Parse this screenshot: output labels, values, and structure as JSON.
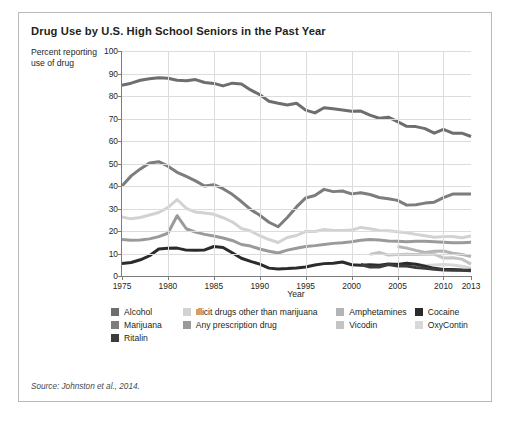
{
  "figure": {
    "title": "Drug Use by U.S. High School Seniors in the Past Year",
    "y_caption": "Percent reporting use of drug",
    "source": "Source: Johnston et al., 2014."
  },
  "legend": {
    "rows": [
      [
        {
          "label": "Alcohol",
          "color": "#6e6e6e",
          "col": "col-a"
        },
        {
          "label": "Illicit drugs other than marijuana",
          "color": "#d2d2d2",
          "col": "col-b"
        },
        {
          "label": "Amphetamines",
          "color": "#b4b4b4",
          "col": "col-c"
        },
        {
          "label": "Cocaine",
          "color": "#2b2b2b",
          "col": "col-d"
        }
      ],
      [
        {
          "label": "Marijuana",
          "color": "#7d7d7d",
          "col": "col-a"
        },
        {
          "label": "Any prescription drug",
          "color": "#9a9a9a",
          "col": "col-b"
        },
        {
          "label": "Vicodin",
          "color": "#c4c4c4",
          "col": "col-c"
        },
        {
          "label": "OxyContin",
          "color": "#d8d8d8",
          "col": "col-d"
        }
      ],
      [
        {
          "label": "Ritalin",
          "color": "#3c3c3c",
          "col": "col-a"
        }
      ]
    ]
  },
  "chart_data": {
    "type": "line",
    "title": "Drug Use by U.S. High School Seniors in the Past Year",
    "xlabel": "Year",
    "ylabel": "Percent reporting use of drug",
    "xlim": [
      1975,
      2013
    ],
    "ylim": [
      0,
      100
    ],
    "ytick_step": 10,
    "yticks": [
      0,
      10,
      20,
      30,
      40,
      50,
      60,
      70,
      80,
      90,
      100
    ],
    "xticks": [
      1975,
      1980,
      1985,
      1990,
      1995,
      2000,
      2005,
      2010,
      2013
    ],
    "xtick_labels": [
      "1975",
      "1980",
      "1985",
      "1990",
      "1995",
      "2000",
      "2005",
      "2010",
      "2013"
    ],
    "xtick_labels_shown": [
      "1975",
      "1980",
      "1985",
      "1990",
      "1995",
      "2000",
      "2005",
      "2010",
      "2013"
    ],
    "grid": true,
    "legend_position": "below",
    "series": [
      {
        "name": "Alcohol",
        "color": "#6e6e6e",
        "x": [
          1975,
          1976,
          1977,
          1978,
          1979,
          1980,
          1981,
          1982,
          1983,
          1984,
          1985,
          1986,
          1987,
          1988,
          1989,
          1990,
          1991,
          1992,
          1993,
          1994,
          1995,
          1996,
          1997,
          1998,
          1999,
          2000,
          2001,
          2002,
          2003,
          2004,
          2005,
          2006,
          2007,
          2008,
          2009,
          2010,
          2011,
          2012,
          2013
        ],
        "values": [
          84.8,
          85.7,
          87.0,
          87.7,
          88.1,
          87.9,
          87.0,
          86.8,
          87.3,
          86.0,
          85.6,
          84.5,
          85.7,
          85.3,
          82.7,
          80.6,
          77.7,
          76.8,
          76.0,
          76.8,
          73.7,
          72.5,
          74.8,
          74.3,
          73.8,
          73.2,
          73.3,
          71.5,
          70.1,
          70.6,
          68.6,
          66.5,
          66.4,
          65.5,
          63.5,
          65.2,
          63.5,
          63.5,
          62.0
        ]
      },
      {
        "name": "Marijuana",
        "color": "#7d7d7d",
        "x": [
          1975,
          1976,
          1977,
          1978,
          1979,
          1980,
          1981,
          1982,
          1983,
          1984,
          1985,
          1986,
          1987,
          1988,
          1989,
          1990,
          1991,
          1992,
          1993,
          1994,
          1995,
          1996,
          1997,
          1998,
          1999,
          2000,
          2001,
          2002,
          2003,
          2004,
          2005,
          2006,
          2007,
          2008,
          2009,
          2010,
          2011,
          2012,
          2013
        ],
        "values": [
          40.0,
          44.5,
          47.6,
          50.2,
          50.8,
          48.8,
          46.1,
          44.3,
          42.3,
          40.0,
          40.6,
          38.8,
          36.3,
          33.1,
          29.6,
          27.0,
          23.9,
          21.9,
          26.0,
          30.7,
          34.7,
          35.8,
          38.5,
          37.5,
          37.8,
          36.5,
          37.0,
          36.2,
          34.9,
          34.3,
          33.6,
          31.5,
          31.7,
          32.4,
          32.8,
          34.8,
          36.4,
          36.4,
          36.4
        ]
      },
      {
        "name": "Illicit drugs other than marijuana",
        "color": "#d2d2d2",
        "x": [
          1975,
          1976,
          1977,
          1978,
          1979,
          1980,
          1981,
          1982,
          1983,
          1984,
          1985,
          1986,
          1987,
          1988,
          1989,
          1990,
          1991,
          1992,
          1993,
          1994,
          1995,
          1996,
          1997,
          1998,
          1999,
          2000,
          2001,
          2002,
          2003,
          2004,
          2005,
          2006,
          2007,
          2008,
          2009,
          2010,
          2011,
          2012,
          2013
        ],
        "values": [
          26.2,
          25.4,
          26.0,
          27.1,
          28.2,
          30.4,
          34.0,
          30.1,
          28.4,
          28.0,
          27.4,
          25.9,
          24.1,
          21.1,
          20.0,
          17.9,
          16.2,
          14.9,
          17.1,
          18.0,
          19.8,
          19.8,
          20.7,
          20.2,
          20.2,
          20.4,
          21.6,
          21.0,
          20.2,
          20.1,
          19.7,
          19.2,
          18.5,
          17.9,
          17.2,
          17.5,
          17.6,
          17.0,
          17.8
        ]
      },
      {
        "name": "Any prescription drug",
        "color": "#9a9a9a",
        "x": [
          1975,
          1976,
          1977,
          1978,
          1979,
          1980,
          1981,
          1982,
          1983,
          1984,
          1985,
          1986,
          1987,
          1988,
          1989,
          1990,
          1991,
          1992,
          1993,
          1994,
          1995,
          1996,
          1997,
          1998,
          1999,
          2000,
          2001,
          2002,
          2003,
          2004,
          2005,
          2006,
          2007,
          2008,
          2009,
          2010,
          2011,
          2012,
          2013
        ],
        "values": [
          16.2,
          15.9,
          16.0,
          16.5,
          17.5,
          19.0,
          26.8,
          21.0,
          19.5,
          18.5,
          17.8,
          16.9,
          15.8,
          14.0,
          13.3,
          12.0,
          11.0,
          10.2,
          11.5,
          12.3,
          13.1,
          13.5,
          14.0,
          14.5,
          14.8,
          15.2,
          15.9,
          16.2,
          16.0,
          15.6,
          15.4,
          15.2,
          15.4,
          15.4,
          15.2,
          15.0,
          14.8,
          14.8,
          15.0
        ]
      },
      {
        "name": "Amphetamines",
        "color": "#b4b4b4",
        "x": [
          2005,
          2006,
          2007,
          2008,
          2009,
          2010,
          2011,
          2012,
          2013
        ],
        "values": [
          13.1,
          12.4,
          11.4,
          10.5,
          11.0,
          11.1,
          10.1,
          9.6,
          8.7
        ]
      },
      {
        "name": "Vicodin",
        "color": "#c4c4c4",
        "x": [
          2002,
          2003,
          2004,
          2005,
          2006,
          2007,
          2008,
          2009,
          2010,
          2011,
          2012,
          2013
        ],
        "values": [
          9.6,
          10.5,
          9.3,
          9.5,
          9.7,
          9.6,
          9.7,
          9.7,
          8.0,
          8.1,
          7.5,
          5.3
        ]
      },
      {
        "name": "OxyContin",
        "color": "#d8d8d8",
        "x": [
          2002,
          2003,
          2004,
          2005,
          2006,
          2007,
          2008,
          2009,
          2010,
          2011,
          2012,
          2013
        ],
        "values": [
          4.0,
          4.5,
          5.0,
          5.5,
          4.3,
          5.2,
          4.7,
          4.9,
          5.1,
          4.9,
          4.3,
          3.6
        ]
      },
      {
        "name": "Cocaine",
        "color": "#2b2b2b",
        "x": [
          1975,
          1976,
          1977,
          1978,
          1979,
          1980,
          1981,
          1982,
          1983,
          1984,
          1985,
          1986,
          1987,
          1988,
          1989,
          1990,
          1991,
          1992,
          1993,
          1994,
          1995,
          1996,
          1997,
          1998,
          1999,
          2000,
          2001,
          2002,
          2003,
          2004,
          2005,
          2006,
          2007,
          2008,
          2009,
          2010,
          2011,
          2012,
          2013
        ],
        "values": [
          5.6,
          6.0,
          7.2,
          9.0,
          12.0,
          12.3,
          12.4,
          11.5,
          11.4,
          11.6,
          13.1,
          12.7,
          10.3,
          7.9,
          6.5,
          5.3,
          3.5,
          3.1,
          3.3,
          3.6,
          4.0,
          4.9,
          5.5,
          5.7,
          6.2,
          5.0,
          4.8,
          5.0,
          4.8,
          5.3,
          5.1,
          5.7,
          5.2,
          4.4,
          3.4,
          2.9,
          2.9,
          2.7,
          2.6
        ]
      },
      {
        "name": "Ritalin",
        "color": "#3c3c3c",
        "x": [
          2001,
          2002,
          2003,
          2004,
          2005,
          2006,
          2007,
          2008,
          2009,
          2010,
          2011,
          2012,
          2013
        ],
        "values": [
          5.1,
          4.0,
          4.0,
          5.1,
          4.4,
          4.4,
          3.8,
          3.4,
          3.0,
          2.7,
          2.6,
          2.6,
          2.3
        ]
      }
    ]
  }
}
